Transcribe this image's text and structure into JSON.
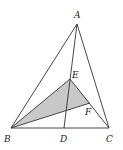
{
  "diagram": {
    "type": "geometry-triangle",
    "points": {
      "A": {
        "label": "A",
        "x": 77,
        "y": 24
      },
      "B": {
        "label": "B",
        "x": 11,
        "y": 128
      },
      "C": {
        "label": "C",
        "x": 109,
        "y": 128
      },
      "D": {
        "label": "D",
        "x": 64,
        "y": 128
      },
      "E": {
        "label": "E",
        "x": 70,
        "y": 79
      },
      "F": {
        "label": "F",
        "x": 90,
        "y": 103
      }
    },
    "segments": [
      "AB",
      "AC",
      "BC",
      "AD",
      "BF",
      "BE",
      "EC"
    ],
    "shaded_region": [
      "B",
      "E",
      "F"
    ],
    "colors": {
      "stroke": "#333333",
      "shade": "#c8c8c8"
    }
  }
}
